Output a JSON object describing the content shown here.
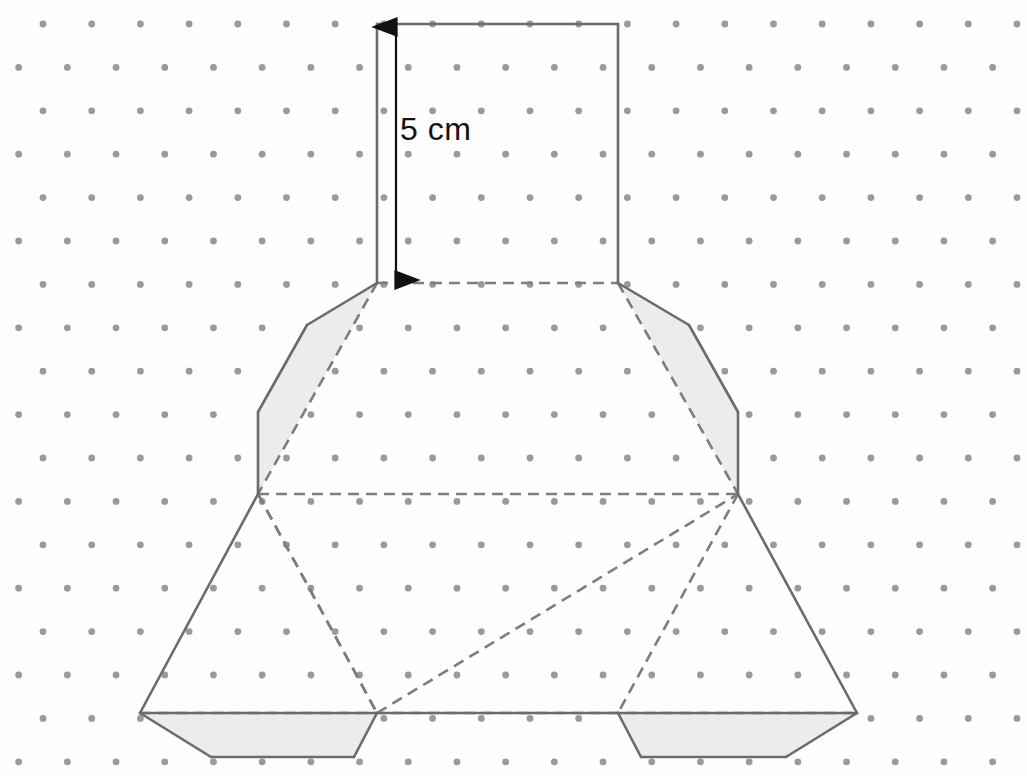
{
  "figure": {
    "canvas": {
      "width": 1027,
      "height": 776,
      "background": "#fefefe"
    }
  },
  "grid": {
    "type": "isometric-dot-grid",
    "dot_color": "#9a9a9a",
    "dot_radius": 3.4,
    "origin_x": 43,
    "origin_y": 24,
    "column_spacing": 48.7,
    "row_spacing": 43.4,
    "row_offset_x": 24.35,
    "columns": 22,
    "rows": 18
  },
  "style": {
    "solid_line_color": "#6b6b6b",
    "dashed_line_color": "#7d7d7d",
    "solid_line_width": 2.6,
    "dashed_line_width": 2.6,
    "dash_pattern": "11,7",
    "shaded_fill": "#ececed",
    "shaded_stroke": "#6b6b6b",
    "label_color": "#111111",
    "arrow_color": "#111111"
  },
  "annotations": {
    "dimension_label": {
      "text": "5 cm",
      "x": 400,
      "y": 113,
      "font_size": 32,
      "color": "#111111"
    },
    "dimension_arrow": {
      "name": "vertical-double-arrow",
      "x": 396,
      "y_top": 26,
      "y_bottom": 281,
      "head_length": 15,
      "head_width": 11
    }
  },
  "shapes": {
    "top_rectangle": {
      "name": "top-rectangle-face",
      "filled": false,
      "solid_edges": [
        [
          377,
          24,
          618,
          24
        ],
        [
          377,
          24,
          377,
          283
        ],
        [
          618,
          24,
          618,
          283
        ]
      ],
      "dashed_edges": [
        [
          377,
          283,
          618,
          283
        ]
      ]
    },
    "left_shaded_flap": {
      "name": "left-shaded-flap",
      "filled": true,
      "points": "377,283 307,325 258,412 258,494",
      "solid_edges": [
        [
          377,
          283,
          307,
          325
        ],
        [
          307,
          325,
          258,
          412
        ],
        [
          258,
          412,
          258,
          494
        ]
      ],
      "dashed_edges": [
        [
          377,
          283,
          258,
          494
        ]
      ]
    },
    "right_shaded_flap": {
      "name": "right-shaded-flap",
      "filled": true,
      "points": "618,283 689,325 738,412 738,494",
      "solid_edges": [
        [
          618,
          283,
          689,
          325
        ],
        [
          689,
          325,
          738,
          412
        ],
        [
          738,
          412,
          738,
          494
        ]
      ],
      "dashed_edges": [
        [
          618,
          283,
          738,
          494
        ]
      ]
    },
    "middle_horizontal_fold": {
      "name": "middle-horizontal-fold-line",
      "dashed_edges": [
        [
          258,
          494,
          738,
          494
        ]
      ]
    },
    "left_triangle": {
      "name": "left-triangle-face",
      "filled": false,
      "solid_edges": [
        [
          258,
          494,
          140,
          713
        ],
        [
          140,
          713,
          377,
          713
        ]
      ],
      "dashed_edges": [
        [
          258,
          494,
          377,
          713
        ]
      ]
    },
    "center_triangle": {
      "name": "center-triangle-face",
      "filled": false,
      "solid_edges": [
        [
          377,
          713,
          618,
          713
        ]
      ],
      "dashed_edges": [
        [
          377,
          713,
          738,
          494
        ],
        [
          258,
          494,
          377,
          713
        ]
      ]
    },
    "right_triangle": {
      "name": "right-triangle-face",
      "filled": false,
      "solid_edges": [
        [
          738,
          494,
          857,
          713
        ],
        [
          618,
          713,
          857,
          713
        ]
      ],
      "dashed_edges": [
        [
          738,
          494,
          618,
          713
        ]
      ]
    },
    "bottom_fold_line": {
      "name": "bottom-horizontal-fold-line",
      "dashed_edges": [
        [
          140,
          713,
          857,
          713
        ]
      ]
    },
    "bottom_left_shaded_flap": {
      "name": "bottom-left-shaded-flap",
      "filled": true,
      "points": "140,713 211,757 354,757 377,713",
      "solid_edges": [
        [
          140,
          713,
          211,
          757
        ],
        [
          211,
          757,
          354,
          757
        ],
        [
          354,
          757,
          377,
          713
        ]
      ]
    },
    "bottom_right_shaded_flap": {
      "name": "bottom-right-shaded-flap",
      "filled": true,
      "points": "618,713 641,757 786,757 857,713",
      "solid_edges": [
        [
          618,
          713,
          641,
          757
        ],
        [
          641,
          757,
          786,
          757
        ],
        [
          786,
          757,
          857,
          713
        ]
      ]
    }
  }
}
